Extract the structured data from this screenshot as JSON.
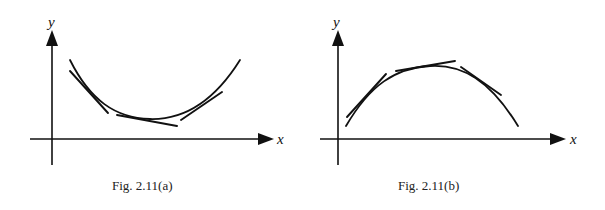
{
  "figures": [
    {
      "id": "a",
      "caption": "Fig. 2.11(a)",
      "x_label": "x",
      "y_label": "y",
      "curve_shape": "concave-up (U-shaped), curve lies above its tangents",
      "tangent_count": 3
    },
    {
      "id": "b",
      "caption": "Fig. 2.11(b)",
      "x_label": "x",
      "y_label": "y",
      "curve_shape": "concave-down (arch-shaped), curve lies below its tangents",
      "tangent_count": 3
    }
  ]
}
